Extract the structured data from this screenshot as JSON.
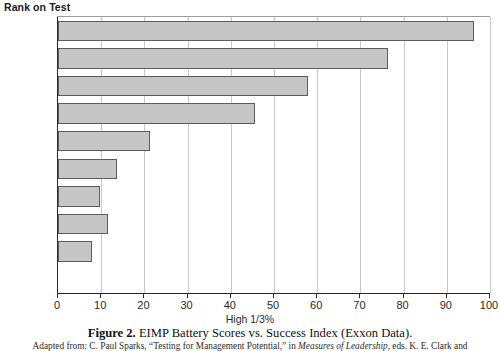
{
  "chart_data": {
    "type": "bar",
    "orientation": "horizontal",
    "title": "",
    "ylabel": "Rank on Test",
    "xlabel": "High 1/3%",
    "categories": [
      "1-44",
      "45-88",
      "89-132",
      "133-176",
      "177-220",
      "221-265",
      "266-310",
      "311-355",
      "356-399",
      "400-443"
    ],
    "values": [
      96.3,
      76.3,
      57.8,
      45.5,
      21.3,
      13.7,
      9.7,
      11.6,
      7.9,
      0
    ],
    "xlim": [
      0,
      100
    ],
    "xticks": [
      0,
      10,
      20,
      30,
      40,
      50,
      60,
      70,
      80,
      90,
      100
    ],
    "xtick_labels": [
      "0",
      "10",
      "20",
      "30",
      "40",
      "50",
      "60",
      "70",
      "80",
      "90",
      "100"
    ],
    "grid": "vertical",
    "legend": "none",
    "bar_fill_color": "#c6c6c6",
    "bar_edge_color": "#5c5c5c",
    "gridline_color": "#c9c9c9",
    "axis_color": "#2a2a2a"
  },
  "figure": {
    "caption_number": "Figure 2.",
    "caption_text": "EIMP Battery Scores vs. Success Index (Exxon Data).",
    "source_prefix": "Adapted from: C. Paul Sparks, “Testing for Management Potential,” in ",
    "source_italic": "Measures of Leadership",
    "source_suffix": ", eds. K. E. Clark and"
  }
}
